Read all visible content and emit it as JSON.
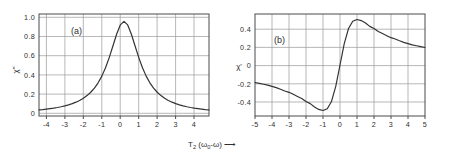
{
  "figure": {
    "background_color": "#ffffff",
    "line_color": "#333333",
    "grid_color": "#9a9a9a",
    "axis_color": "#4a4a4a",
    "shared_xlabel_main": "T",
    "shared_xlabel_sub": "2",
    "shared_xlabel_paren": "(ω",
    "shared_xlabel_paren_sub": "0",
    "shared_xlabel_paren_tail": "-ω)",
    "shared_xlabel_arrow": "⟶"
  },
  "panel_a": {
    "tag": "(a)",
    "ylabel": "χ\"",
    "ytick_labels": [
      "1.0",
      "0.8",
      "0.6",
      "0.4",
      "0.2",
      "0"
    ],
    "xtick_labels": [
      "-4",
      "-3",
      "-2",
      "-1",
      "0",
      "1",
      "2",
      "3",
      "4"
    ]
  },
  "panel_b": {
    "tag": "(b)",
    "ylabel": "χ'",
    "ytick_labels": [
      "0.4",
      "0.2",
      "0",
      "-0.2",
      "-0.4"
    ],
    "xtick_labels": [
      "-5",
      "-4",
      "-3",
      "-2",
      "-1",
      "0",
      "1",
      "2",
      "3",
      "4",
      "5"
    ]
  },
  "chart_data": [
    {
      "id": "panel_a",
      "type": "line",
      "title": "(a)",
      "subtitle": "Lorentzian absorption lineshape",
      "xlabel": "T2 (ω0-ω)",
      "ylabel": "χ\"",
      "xlim": [
        -4.6,
        4.6
      ],
      "ylim": [
        -0.02,
        1.08
      ],
      "grid": true,
      "legend": "none",
      "xticks": [
        -4,
        -3,
        -2,
        -1,
        0,
        1,
        2,
        3,
        4
      ],
      "xtick_labels": [
        "-4",
        "-3",
        "-2",
        "-1",
        "0",
        "1",
        "2",
        "3",
        "4"
      ],
      "yticks": [
        0,
        0.2,
        0.4,
        0.6,
        0.8,
        1.0
      ],
      "ytick_labels": [
        "0",
        "0.2",
        "0.4",
        "0.6",
        "0.8",
        "1.0"
      ],
      "equation": "y = 1 / (1 + x^2)",
      "x": [
        -4.6,
        -4.4,
        -4.2,
        -4.0,
        -3.8,
        -3.6,
        -3.4,
        -3.2,
        -3.0,
        -2.8,
        -2.6,
        -2.4,
        -2.2,
        -2.0,
        -1.8,
        -1.6,
        -1.4,
        -1.2,
        -1.0,
        -0.8,
        -0.6,
        -0.4,
        -0.2,
        0.0,
        0.2,
        0.4,
        0.6,
        0.8,
        1.0,
        1.2,
        1.4,
        1.6,
        1.8,
        2.0,
        2.2,
        2.4,
        2.6,
        2.8,
        3.0,
        3.2,
        3.4,
        3.6,
        3.8,
        4.0,
        4.2,
        4.4,
        4.6
      ],
      "y": [
        0.045,
        0.049,
        0.054,
        0.059,
        0.065,
        0.072,
        0.08,
        0.089,
        0.1,
        0.113,
        0.129,
        0.148,
        0.171,
        0.2,
        0.236,
        0.281,
        0.338,
        0.41,
        0.5,
        0.61,
        0.735,
        0.862,
        0.962,
        1.0,
        0.962,
        0.862,
        0.735,
        0.61,
        0.5,
        0.41,
        0.338,
        0.281,
        0.236,
        0.2,
        0.171,
        0.148,
        0.129,
        0.113,
        0.1,
        0.089,
        0.08,
        0.072,
        0.065,
        0.059,
        0.054,
        0.049,
        0.045
      ],
      "annotations": [
        {
          "text": "(a)",
          "x": -2.6,
          "y": 0.9
        },
        {
          "text": "peak value 1.0 at x = 0",
          "x": 0,
          "y": 1.0
        }
      ]
    },
    {
      "id": "panel_b",
      "type": "line",
      "title": "(b)",
      "subtitle": "Dispersion lineshape",
      "xlabel": "T2 (ω0-ω)",
      "ylabel": "χ'",
      "xlim": [
        -5,
        5
      ],
      "ylim": [
        -0.56,
        0.56
      ],
      "grid": true,
      "legend": "none",
      "xticks": [
        -5,
        -4,
        -3,
        -2,
        -1,
        0,
        1,
        2,
        3,
        4,
        5
      ],
      "xtick_labels": [
        "-5",
        "-4",
        "-3",
        "-2",
        "-1",
        "0",
        "1",
        "2",
        "3",
        "4",
        "5"
      ],
      "yticks": [
        -0.4,
        -0.2,
        0,
        0.2,
        0.4
      ],
      "ytick_labels": [
        "-0.4",
        "-0.2",
        "0",
        "0.2",
        "0.4"
      ],
      "equation": "y = x / (1 + x^2)",
      "x": [
        -5.0,
        -4.75,
        -4.5,
        -4.25,
        -4.0,
        -3.75,
        -3.5,
        -3.25,
        -3.0,
        -2.75,
        -2.5,
        -2.25,
        -2.0,
        -1.75,
        -1.5,
        -1.25,
        -1.0,
        -0.75,
        -0.5,
        -0.25,
        0.0,
        0.25,
        0.5,
        0.75,
        1.0,
        1.25,
        1.5,
        1.75,
        2.0,
        2.25,
        2.5,
        2.75,
        3.0,
        3.25,
        3.5,
        3.75,
        4.0,
        4.25,
        4.5,
        4.75,
        5.0
      ],
      "y": [
        -0.192,
        -0.201,
        -0.211,
        -0.221,
        -0.235,
        -0.249,
        -0.266,
        -0.285,
        -0.3,
        -0.322,
        -0.345,
        -0.367,
        -0.4,
        -0.424,
        -0.462,
        -0.488,
        -0.5,
        -0.48,
        -0.4,
        -0.235,
        0.0,
        0.235,
        0.4,
        0.48,
        0.5,
        0.488,
        0.462,
        0.424,
        0.4,
        0.367,
        0.345,
        0.322,
        0.3,
        0.285,
        0.266,
        0.249,
        0.235,
        0.221,
        0.211,
        0.201,
        0.192
      ],
      "annotations": [
        {
          "text": "(b)",
          "x": -3.6,
          "y": 0.3
        },
        {
          "text": "minimum -0.5 at x = -1",
          "x": -1,
          "y": -0.5
        },
        {
          "text": "maximum +0.5 at x = 1",
          "x": 1,
          "y": 0.5
        }
      ]
    }
  ]
}
